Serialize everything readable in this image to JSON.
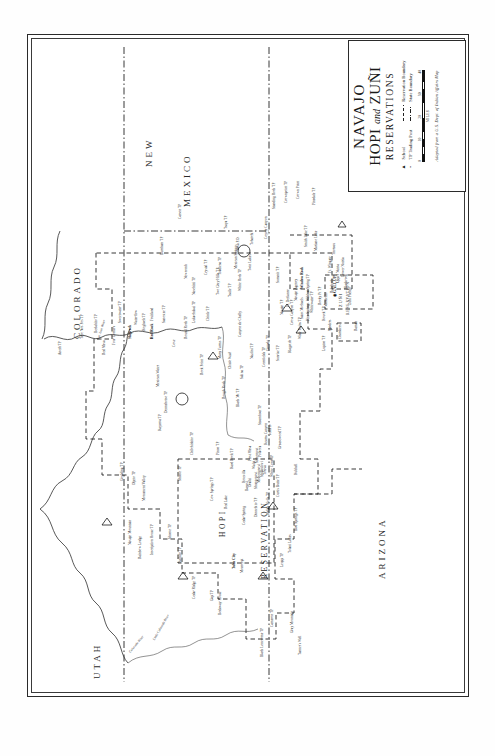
{
  "document": {
    "type": "historical-map",
    "orientation": "landscape-content-rotated-90ccw",
    "background": "#ffffff",
    "ink": "#161616"
  },
  "cartouche": {
    "title_line1": "NAVAJO",
    "title_line2_a": "HOPI",
    "title_line2_and": "and",
    "title_line2_b": "ZUÑI",
    "title_line3": "RESERVATIONS",
    "legend": {
      "symbols": [
        {
          "symbol": "▲",
          "label": "School",
          "icon": "triangle-school-icon"
        },
        {
          "symbol": "•",
          "label": "TP Trading Post",
          "icon": "dot-trading-post-icon"
        }
      ],
      "lines": [
        {
          "style": "dashed",
          "label": "Reservation Boundary",
          "icon": "dashed-line-icon"
        },
        {
          "style": "dash-dot",
          "label": "State Boundary",
          "icon": "dash-dot-line-icon"
        }
      ]
    },
    "scale": {
      "ticks": [
        "0",
        "10",
        "20",
        "30",
        "40"
      ],
      "units": "MILES"
    },
    "attribution": "Adapted from a U.S. Dept. of Indian Affairs Map"
  },
  "states": [
    {
      "name": "UTAH",
      "id": "state-utah"
    },
    {
      "name": "COLORADO",
      "id": "state-colorado"
    },
    {
      "name": "ARIZONA",
      "id": "state-arizona"
    },
    {
      "name": "NEW",
      "id": "state-new"
    },
    {
      "name": "MEXICO",
      "id": "state-mexico"
    }
  ],
  "reservations": [
    {
      "name": "HOPI",
      "id": "hopi-label"
    },
    {
      "name": "RESERVATION",
      "id": "hopi-reservation-label"
    },
    {
      "name": "ZUÑI",
      "id": "zuni-label"
    },
    {
      "name": "RESERVATION",
      "id": "zuni-reservation-label"
    }
  ],
  "cities": [
    {
      "name": "GALLUP",
      "symbol": "◉"
    }
  ],
  "rivers": [
    {
      "name": "San Juan River"
    },
    {
      "name": "Colorado River"
    },
    {
      "name": "Little Colorado River"
    },
    {
      "name": "Chinle Wash"
    }
  ],
  "places": [
    {
      "name": "Aneth TP"
    },
    {
      "name": "Teec Nos Pos TP"
    },
    {
      "name": "Beclabito TP"
    },
    {
      "name": "Four Corners"
    },
    {
      "name": "Red Mesa"
    },
    {
      "name": "Shiprock"
    },
    {
      "name": "Sweetwater TP"
    },
    {
      "name": "Red Rock"
    },
    {
      "name": "Sanostee TP"
    },
    {
      "name": "Burnham TP"
    },
    {
      "name": "Carson TP"
    },
    {
      "name": "Cove"
    },
    {
      "name": "Round Rock TP"
    },
    {
      "name": "Lukachukai TP"
    },
    {
      "name": "Chinle TP"
    },
    {
      "name": "Naschitti TP"
    },
    {
      "name": "Newcomb"
    },
    {
      "name": "Crystal TP"
    },
    {
      "name": "Two Grey Hills TP"
    },
    {
      "name": "Toadlena TP"
    },
    {
      "name": "Mexican Springs"
    },
    {
      "name": "Twin Lakes"
    },
    {
      "name": "Nava P.O."
    },
    {
      "name": "Tohatchi"
    },
    {
      "name": "Coyote Canyon"
    },
    {
      "name": "Navajo TP"
    },
    {
      "name": "Window Rock"
    },
    {
      "name": "Ft. Defiance"
    },
    {
      "name": "Navajo Agency"
    },
    {
      "name": "Wildcat Spring TP"
    },
    {
      "name": "Summit TP"
    },
    {
      "name": "Standing Rock TP"
    },
    {
      "name": "Crownpoint TP"
    },
    {
      "name": "Crown Point"
    },
    {
      "name": "Pinedale TP"
    },
    {
      "name": "Smith Lake TP"
    },
    {
      "name": "Mariano Lake"
    },
    {
      "name": "Thoreau"
    },
    {
      "name": "Rock Point TP"
    },
    {
      "name": "Many Farms TP"
    },
    {
      "name": "Rough Rock TP"
    },
    {
      "name": "Black Mt TP"
    },
    {
      "name": "Salina TP"
    },
    {
      "name": "Nazlini TP"
    },
    {
      "name": "Ganado TP"
    },
    {
      "name": "Cornfields TP"
    },
    {
      "name": "Sunrise TP"
    },
    {
      "name": "Klagetoh TP"
    },
    {
      "name": "Wide Ruins TP"
    },
    {
      "name": "Pine Springs"
    },
    {
      "name": "Houck TP"
    },
    {
      "name": "Sanders"
    },
    {
      "name": "Chilchinbito TP"
    },
    {
      "name": "Kayenta TP"
    },
    {
      "name": "Dennehotso TP"
    },
    {
      "name": "Mexican Water"
    },
    {
      "name": "Shonto TP"
    },
    {
      "name": "Oljeto TP"
    },
    {
      "name": "Goulding TP"
    },
    {
      "name": "Monument Valley"
    },
    {
      "name": "Navajo Mountain"
    },
    {
      "name": "Rainbow Lodge"
    },
    {
      "name": "Inscription House TP"
    },
    {
      "name": "Shonto TP"
    },
    {
      "name": "Kaibito TP"
    },
    {
      "name": "Cedar Ridge TP"
    },
    {
      "name": "Gap TP"
    },
    {
      "name": "Bodaway House"
    },
    {
      "name": "Cedar Spring"
    },
    {
      "name": "Dinnebito TP"
    },
    {
      "name": "Indian Wells TP"
    },
    {
      "name": "Leupp TP"
    },
    {
      "name": "Tolani Lakes"
    },
    {
      "name": "Bird Springs TP"
    },
    {
      "name": "Cameron TP"
    },
    {
      "name": "Gray Mountain"
    },
    {
      "name": "Tanner's Well"
    },
    {
      "name": "Black Lonesome TP"
    },
    {
      "name": "Tuba City"
    },
    {
      "name": "Moencopi"
    },
    {
      "name": "Red Lake"
    },
    {
      "name": "Cow Springs TP"
    },
    {
      "name": "Hard Rock TP"
    },
    {
      "name": "Pinon TP"
    },
    {
      "name": "Oraibi"
    },
    {
      "name": "Hotevilla"
    },
    {
      "name": "Bacavi"
    },
    {
      "name": "Shungopovi"
    },
    {
      "name": "Mishongnovi"
    },
    {
      "name": "Shipaulovi"
    },
    {
      "name": "Walpi"
    },
    {
      "name": "Sichomovi"
    },
    {
      "name": "Polacca"
    },
    {
      "name": "Keams Canyon"
    },
    {
      "name": "First Mesa"
    },
    {
      "name": "Toreva"
    },
    {
      "name": "Jeddito"
    },
    {
      "name": "Curtis Butte TP"
    },
    {
      "name": "White Cone TP"
    },
    {
      "name": "Greasewood TP"
    },
    {
      "name": "Hubbell"
    },
    {
      "name": "Steamboat TP"
    },
    {
      "name": "Tsaile TP"
    },
    {
      "name": "White Rock TP"
    },
    {
      "name": "Canyon de Chelly"
    },
    {
      "name": "Lupton TP"
    },
    {
      "name": "Cross Canyon TP"
    },
    {
      "name": "Saint Michaels"
    },
    {
      "name": "Chambers"
    },
    {
      "name": "Zuñi Pueblo"
    },
    {
      "name": "Ramah"
    },
    {
      "name": "Blackrock"
    },
    {
      "name": "Upper Nutria"
    },
    {
      "name": "Lower Nutria"
    },
    {
      "name": "Ft. Wingate"
    },
    {
      "name": "Rehoboth"
    },
    {
      "name": "Manuelito"
    },
    {
      "name": "Rocky Pt TP"
    },
    {
      "name": "Whitewater TP"
    },
    {
      "name": "Tsaya TP"
    },
    {
      "name": "Fruitland"
    },
    {
      "name": "Hogback TP"
    },
    {
      "name": "Waterflow"
    }
  ]
}
